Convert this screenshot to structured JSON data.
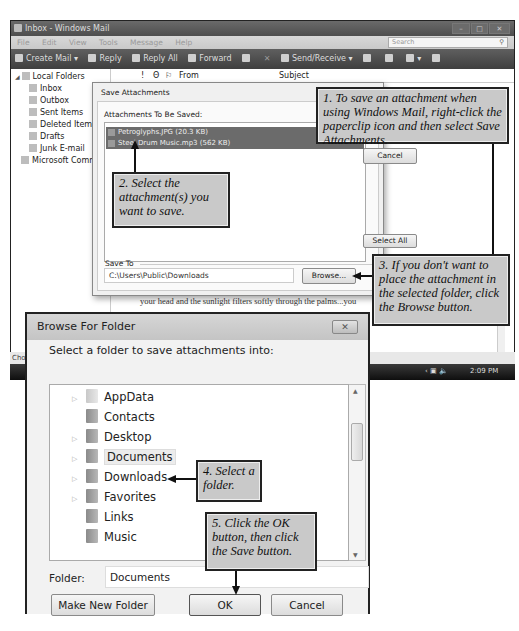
{
  "mail_window": {
    "title": "Inbox - Windows Mail",
    "menu": [
      "File",
      "Edit",
      "View",
      "Tools",
      "Message",
      "Help"
    ],
    "search_placeholder": "Search",
    "toolbar": [
      "Create Mail",
      "Reply",
      "Reply All",
      "Forward",
      "Send/Receive"
    ],
    "folders": [
      {
        "label": "Local Folders",
        "level": 0
      },
      {
        "label": "Inbox",
        "level": 1
      },
      {
        "label": "Outbox",
        "level": 1
      },
      {
        "label": "Sent Items",
        "level": 1
      },
      {
        "label": "Deleted Items",
        "level": 1
      },
      {
        "label": "Drafts",
        "level": 1
      },
      {
        "label": "Junk E-mail",
        "level": 1
      },
      {
        "label": "Microsoft Communities",
        "level": 0
      }
    ],
    "columns": {
      "flag": "!",
      "attach": "Θ",
      "flag2": "⚐",
      "from": "From",
      "subject": "Subject"
    },
    "sender_snippet": ".com <ann_...",
    "body_snippet": "your head and the sunlight filters softly through the palms...you",
    "status_snippet": "Cho",
    "clock": "2:09 PM"
  },
  "save_dialog": {
    "title": "Save Attachments",
    "list_label": "Attachments To Be Saved:",
    "attachments": [
      "Petroglyphs.JPG (20.3 KB)",
      "Steel Drum Music.mp3 (562 KB)"
    ],
    "cancel_label": "Cancel",
    "select_all_label": "Select All",
    "save_to_label": "Save To",
    "save_to_path": "C:\\Users\\Public\\Downloads",
    "browse_label": "Browse..."
  },
  "browse_dialog": {
    "title": "Browse For Folder",
    "close_glyph": "✕",
    "prompt": "Select a folder to save attachments into:",
    "folders": [
      {
        "label": "AppData",
        "expandable": true
      },
      {
        "label": "Contacts",
        "expandable": false
      },
      {
        "label": "Desktop",
        "expandable": true
      },
      {
        "label": "Documents",
        "expandable": true,
        "selected": true
      },
      {
        "label": "Downloads",
        "expandable": true
      },
      {
        "label": "Favorites",
        "expandable": true
      },
      {
        "label": "Links",
        "expandable": false
      },
      {
        "label": "Music",
        "expandable": false
      }
    ],
    "folder_label": "Folder:",
    "folder_value": "Documents",
    "make_new_folder_label": "Make New Folder",
    "ok_label": "OK",
    "cancel_label": "Cancel"
  },
  "callouts": {
    "step1": "1. To save an attachment when using Windows Mail, right-click the paperclip icon and then select Save Attachments.",
    "step2": "2. Select the attachment(s) you want to save.",
    "step3": "3. If you don't want to place the attachment in the selected folder, click the Browse button.",
    "step4": "4. Select a folder.",
    "step5": "5. Click the OK button, then click the Save button."
  }
}
